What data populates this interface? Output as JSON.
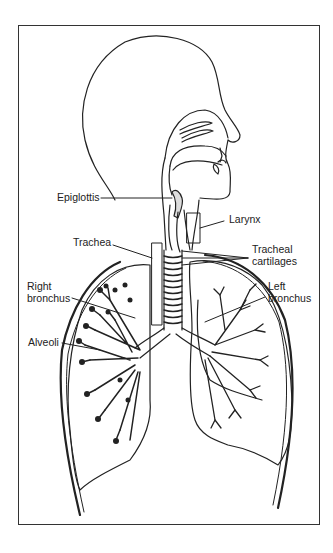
{
  "diagram": {
    "colors": {
      "line": "#222222",
      "background": "#ffffff",
      "frame": "#333333"
    },
    "labels": {
      "epiglottis": "Epiglottis",
      "larynx": "Larynx",
      "trachea": "Trachea",
      "tracheal_cartilages_1": "Tracheal",
      "tracheal_cartilages_2": "cartilages",
      "right_bronchus_1": "Right",
      "right_bronchus_2": "bronchus",
      "left_bronchus_1": "Left",
      "left_bronchus_2": "bronchus",
      "alveoli": "Alveoli"
    }
  }
}
